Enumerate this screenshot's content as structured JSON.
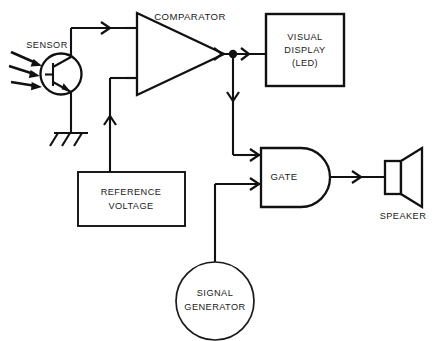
{
  "diagram": {
    "background_color": "#ffffff",
    "line_color": "#111111",
    "blocks": {
      "sensor": {
        "label": "SENSOR",
        "type": "phototransistor",
        "light_arrow_count": 3
      },
      "comparator": {
        "label": "COMPARATOR",
        "type": "triangle-amplifier",
        "input_count": 2
      },
      "visual_display": {
        "line1": "VISUAL",
        "line2": "DISPLAY",
        "line3": "(LED)",
        "type": "rectangle"
      },
      "reference_voltage": {
        "line1": "REFERENCE",
        "line2": "VOLTAGE",
        "type": "rectangle"
      },
      "gate": {
        "label": "GATE",
        "type": "and-gate",
        "input_count": 2
      },
      "signal_generator": {
        "line1": "SIGNAL",
        "line2": "GENERATOR",
        "type": "ellipse"
      },
      "speaker": {
        "label": "SPEAKER",
        "type": "horn"
      },
      "ground": {
        "label": "",
        "type": "earth-ground",
        "hatch_count": 3
      }
    },
    "connections": [
      {
        "name": "sensor-to-comparator",
        "from": "sensor",
        "to": "comparator",
        "arrow": true
      },
      {
        "name": "sensor-to-ground",
        "from": "sensor",
        "to": "ground",
        "arrow": false
      },
      {
        "name": "reference-to-comparator",
        "from": "reference_voltage",
        "to": "comparator",
        "arrow": true
      },
      {
        "name": "comparator-to-display",
        "from": "comparator",
        "to": "visual_display",
        "arrow": true
      },
      {
        "name": "comparator-to-gate",
        "from": "comparator",
        "to": "gate",
        "arrow": true
      },
      {
        "name": "signal-generator-to-gate",
        "from": "signal_generator",
        "to": "gate",
        "arrow": true
      },
      {
        "name": "gate-to-speaker",
        "from": "gate",
        "to": "speaker",
        "arrow": true
      }
    ]
  }
}
